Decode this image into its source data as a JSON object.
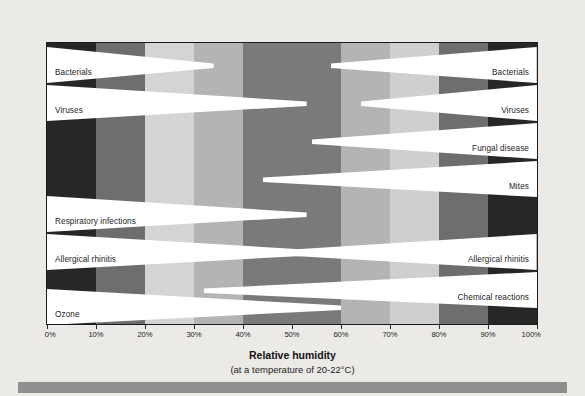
{
  "chart_data": {
    "type": "bar",
    "title": "",
    "xlabel": "Relative humidity",
    "xlabel_sub": "(at a temperature of 20-22°C)",
    "ylabel": "",
    "xlim": [
      0,
      100
    ],
    "xunit": "%",
    "grid": false,
    "legend": "none",
    "tick_labels": [
      "0%",
      "10%",
      "20%",
      "30%",
      "40%",
      "50%",
      "60%",
      "70%",
      "80%",
      "90%",
      "100%"
    ],
    "tick_values": [
      0,
      10,
      20,
      30,
      40,
      50,
      60,
      70,
      80,
      90,
      100
    ],
    "background_bands": [
      {
        "from": 0,
        "to": 10,
        "color": "#272727"
      },
      {
        "from": 10,
        "to": 20,
        "color": "#6e6e6e"
      },
      {
        "from": 20,
        "to": 30,
        "color": "#d4d4d4"
      },
      {
        "from": 30,
        "to": 40,
        "color": "#b4b4b4"
      },
      {
        "from": 40,
        "to": 60,
        "color": "#7a7a7a"
      },
      {
        "from": 60,
        "to": 70,
        "color": "#b4b4b4"
      },
      {
        "from": 70,
        "to": 80,
        "color": "#cfcfcf"
      },
      {
        "from": 80,
        "to": 90,
        "color": "#6e6e6e"
      },
      {
        "from": 90,
        "to": 100,
        "color": "#272727"
      }
    ],
    "bar_color": "#ffffff",
    "bars": [
      {
        "name": "Bacterials",
        "side": "left",
        "label": "Bacterials",
        "start": 0,
        "end": 34,
        "row": 0
      },
      {
        "name": "Bacterials",
        "side": "right",
        "label": "Bacterials",
        "start": 100,
        "end": 58,
        "row": 0
      },
      {
        "name": "Viruses",
        "side": "left",
        "label": "Viruses",
        "start": 0,
        "end": 53,
        "row": 1
      },
      {
        "name": "Viruses",
        "side": "right",
        "label": "Viruses",
        "start": 100,
        "end": 64,
        "row": 1
      },
      {
        "name": "Fungal disease",
        "side": "right",
        "label": "Fungal disease",
        "start": 100,
        "end": 54,
        "row": 2
      },
      {
        "name": "Mites",
        "side": "right",
        "label": "Mites",
        "start": 100,
        "end": 44,
        "row": 3
      },
      {
        "name": "Respiratory infections",
        "side": "left",
        "label": "Respiratory infections",
        "start": 0,
        "end": 53,
        "row": 4
      },
      {
        "name": "Allergical rhinitis",
        "side": "left",
        "label": "Allergical rhinitis",
        "start": 0,
        "end": 56,
        "row": 5
      },
      {
        "name": "Allergical rhinitis",
        "side": "right",
        "label": "Allergical rhinitis",
        "start": 100,
        "end": 47,
        "row": 5
      },
      {
        "name": "Chemical reactions",
        "side": "right",
        "label": "Chemical reactions",
        "start": 100,
        "end": 32,
        "row": 6
      },
      {
        "name": "Ozone",
        "side": "left",
        "label": "Ozone",
        "start": 0,
        "end": 60,
        "row": 7
      }
    ],
    "row_bounds": [
      {
        "row": 0,
        "top": 4,
        "height": 36
      },
      {
        "row": 1,
        "top": 42,
        "height": 36
      },
      {
        "row": 2,
        "top": 80,
        "height": 36
      },
      {
        "row": 3,
        "top": 118,
        "height": 36
      },
      {
        "row": 4,
        "top": 153,
        "height": 36
      },
      {
        "row": 5,
        "top": 191,
        "height": 36
      },
      {
        "row": 6,
        "top": 229,
        "height": 36
      },
      {
        "row": 7,
        "top": 246,
        "height": 36
      }
    ]
  },
  "colors": {
    "page_background": "#eceae7",
    "footer_bar": "#8f8f8f",
    "plot_border": "#1a1a1a",
    "text": "#1c1c1c"
  }
}
